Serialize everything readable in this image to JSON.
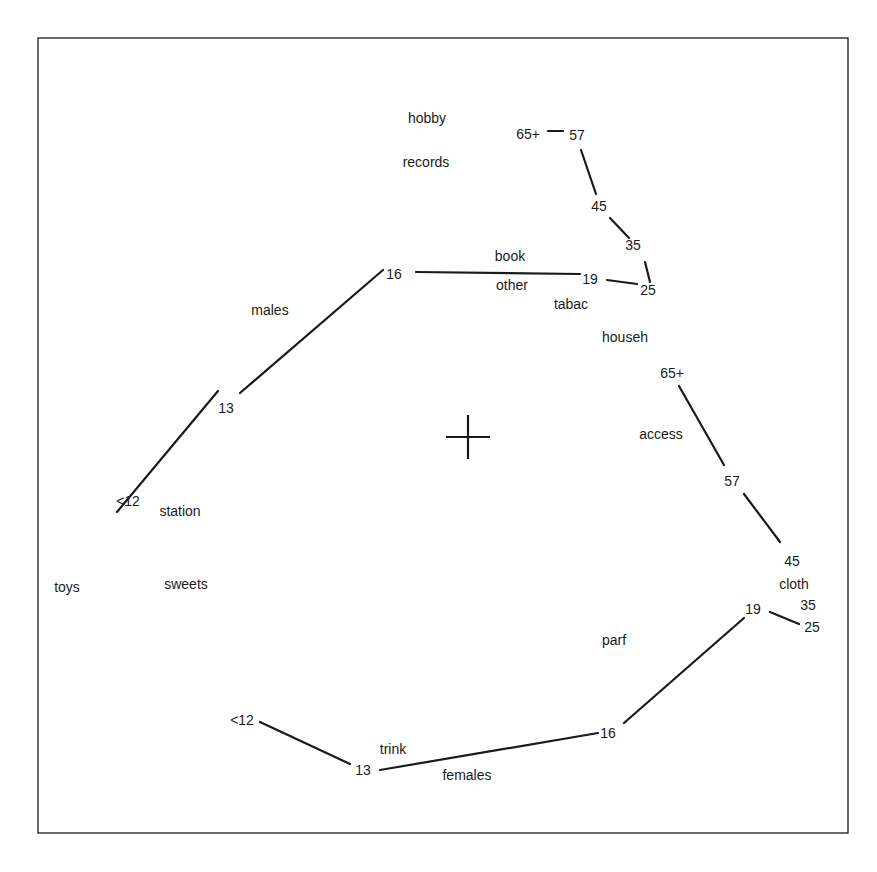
{
  "chart_data": {
    "type": "scatter",
    "title": "",
    "xlabel": "",
    "ylabel": "",
    "grid": false,
    "frame": {
      "x": 38,
      "y": 38,
      "width": 810,
      "height": 795
    },
    "origin_marker": {
      "x": 468,
      "y": 437,
      "size": 22
    },
    "category_points": [
      {
        "label": "hobby",
        "x": 427,
        "y": 118
      },
      {
        "label": "records",
        "x": 426,
        "y": 162
      },
      {
        "label": "book",
        "x": 510,
        "y": 256
      },
      {
        "label": "other",
        "x": 512,
        "y": 285
      },
      {
        "label": "tabac",
        "x": 571,
        "y": 304
      },
      {
        "label": "househ",
        "x": 625,
        "y": 337
      },
      {
        "label": "access",
        "x": 661,
        "y": 434
      },
      {
        "label": "station",
        "x": 180,
        "y": 511
      },
      {
        "label": "toys",
        "x": 67,
        "y": 587
      },
      {
        "label": "sweets",
        "x": 186,
        "y": 584
      },
      {
        "label": "cloth",
        "x": 794,
        "y": 584
      },
      {
        "label": "parf",
        "x": 614,
        "y": 640
      },
      {
        "label": "trink",
        "x": 393,
        "y": 749
      },
      {
        "label": "females",
        "x": 467,
        "y": 775
      },
      {
        "label": "males",
        "x": 270,
        "y": 310
      }
    ],
    "series": [
      {
        "name": "males",
        "points": [
          {
            "label": "<12",
            "x": 128,
            "y": 501
          },
          {
            "label": "13",
            "x": 226,
            "y": 408
          },
          {
            "label": "16",
            "x": 394,
            "y": 274
          },
          {
            "label": "19",
            "x": 590,
            "y": 279
          },
          {
            "label": "25",
            "x": 648,
            "y": 290
          },
          {
            "label": "35",
            "x": 633,
            "y": 245
          },
          {
            "label": "45",
            "x": 599,
            "y": 206
          },
          {
            "label": "57",
            "x": 577,
            "y": 135
          },
          {
            "label": "65+",
            "x": 528,
            "y": 134
          }
        ],
        "segments": [
          [
            [
              117,
              512
            ],
            [
              218,
              391
            ]
          ],
          [
            [
              240,
              393
            ],
            [
              383,
              270
            ]
          ],
          [
            [
              416,
              272
            ],
            [
              580,
              274
            ]
          ],
          [
            [
              607,
              280
            ],
            [
              637,
              284
            ]
          ],
          [
            [
              650,
              282
            ],
            [
              645,
              262
            ]
          ],
          [
            [
              629,
              238
            ],
            [
              610,
              218
            ]
          ],
          [
            [
              596,
              194
            ],
            [
              581,
              150
            ]
          ],
          [
            [
              548,
              131
            ],
            [
              563,
              131
            ]
          ]
        ]
      },
      {
        "name": "females",
        "points": [
          {
            "label": "<12",
            "x": 242,
            "y": 720
          },
          {
            "label": "13",
            "x": 363,
            "y": 770
          },
          {
            "label": "16",
            "x": 608,
            "y": 733
          },
          {
            "label": "19",
            "x": 753,
            "y": 609
          },
          {
            "label": "25",
            "x": 812,
            "y": 627
          },
          {
            "label": "35",
            "x": 808,
            "y": 605
          },
          {
            "label": "45",
            "x": 792,
            "y": 561
          },
          {
            "label": "57",
            "x": 732,
            "y": 481
          },
          {
            "label": "65+",
            "x": 672,
            "y": 373
          }
        ],
        "segments": [
          [
            [
              260,
              722
            ],
            [
              350,
              764
            ]
          ],
          [
            [
              380,
              770
            ],
            [
              598,
              733
            ]
          ],
          [
            [
              624,
              723
            ],
            [
              744,
              618
            ]
          ],
          [
            [
              770,
              612
            ],
            [
              799,
              624
            ]
          ],
          [
            [
              744,
              494
            ],
            [
              780,
              542
            ]
          ],
          [
            [
              679,
              386
            ],
            [
              724,
              465
            ]
          ]
        ]
      }
    ]
  }
}
